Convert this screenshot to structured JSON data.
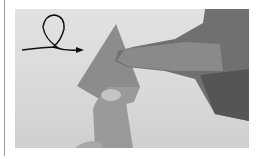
{
  "figure": {
    "colors": {
      "background": "#dcdcdc",
      "paper": "#8a8a8a",
      "hand": "#6e6e6e",
      "arrow": "#111111"
    }
  }
}
